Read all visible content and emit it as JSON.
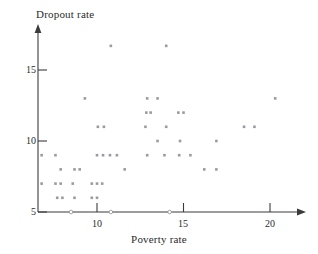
{
  "chart_data": {
    "type": "scatter",
    "title": "",
    "xlabel": "Poverty rate",
    "ylabel": "Dropout rate",
    "xlim": [
      6.3,
      21.2
    ],
    "ylim": [
      5,
      17.4
    ],
    "xticks": [
      10,
      15,
      20
    ],
    "xticklabels": [
      "10",
      "15",
      "20"
    ],
    "yticks": [
      5,
      10,
      15
    ],
    "yticklabels": [
      "5",
      "10",
      "15"
    ],
    "grid": false,
    "legend": null,
    "marker": "square",
    "marker_color": "#9a9aa2",
    "points": [
      {
        "x": 6.8,
        "y": 9
      },
      {
        "x": 6.8,
        "y": 7
      },
      {
        "x": 7.6,
        "y": 9
      },
      {
        "x": 7.6,
        "y": 7
      },
      {
        "x": 7.9,
        "y": 7
      },
      {
        "x": 7.7,
        "y": 6
      },
      {
        "x": 8.0,
        "y": 6
      },
      {
        "x": 7.9,
        "y": 8
      },
      {
        "x": 8.6,
        "y": 7
      },
      {
        "x": 8.7,
        "y": 6
      },
      {
        "x": 8.7,
        "y": 8
      },
      {
        "x": 9.0,
        "y": 8
      },
      {
        "x": 9.3,
        "y": 13
      },
      {
        "x": 9.7,
        "y": 6
      },
      {
        "x": 10.0,
        "y": 6
      },
      {
        "x": 9.7,
        "y": 7
      },
      {
        "x": 10.0,
        "y": 7
      },
      {
        "x": 10.3,
        "y": 7
      },
      {
        "x": 10.0,
        "y": 9
      },
      {
        "x": 10.35,
        "y": 9
      },
      {
        "x": 10.75,
        "y": 9
      },
      {
        "x": 11.15,
        "y": 9
      },
      {
        "x": 10.05,
        "y": 11
      },
      {
        "x": 10.4,
        "y": 11
      },
      {
        "x": 10.8,
        "y": 16.7
      },
      {
        "x": 11.6,
        "y": 8
      },
      {
        "x": 12.8,
        "y": 11
      },
      {
        "x": 12.85,
        "y": 12
      },
      {
        "x": 13.1,
        "y": 12
      },
      {
        "x": 12.9,
        "y": 13
      },
      {
        "x": 13.5,
        "y": 13
      },
      {
        "x": 12.9,
        "y": 9
      },
      {
        "x": 13.5,
        "y": 10
      },
      {
        "x": 13.9,
        "y": 9
      },
      {
        "x": 14.0,
        "y": 16.7
      },
      {
        "x": 14.0,
        "y": 11
      },
      {
        "x": 14.7,
        "y": 12
      },
      {
        "x": 15.0,
        "y": 12
      },
      {
        "x": 14.8,
        "y": 10
      },
      {
        "x": 14.75,
        "y": 9
      },
      {
        "x": 15.4,
        "y": 9
      },
      {
        "x": 16.2,
        "y": 8
      },
      {
        "x": 16.9,
        "y": 8
      },
      {
        "x": 16.9,
        "y": 10
      },
      {
        "x": 18.5,
        "y": 11
      },
      {
        "x": 19.1,
        "y": 11
      },
      {
        "x": 20.3,
        "y": 13
      }
    ],
    "axis_open_marks_x": [
      8.5,
      10.8,
      14.2
    ]
  }
}
